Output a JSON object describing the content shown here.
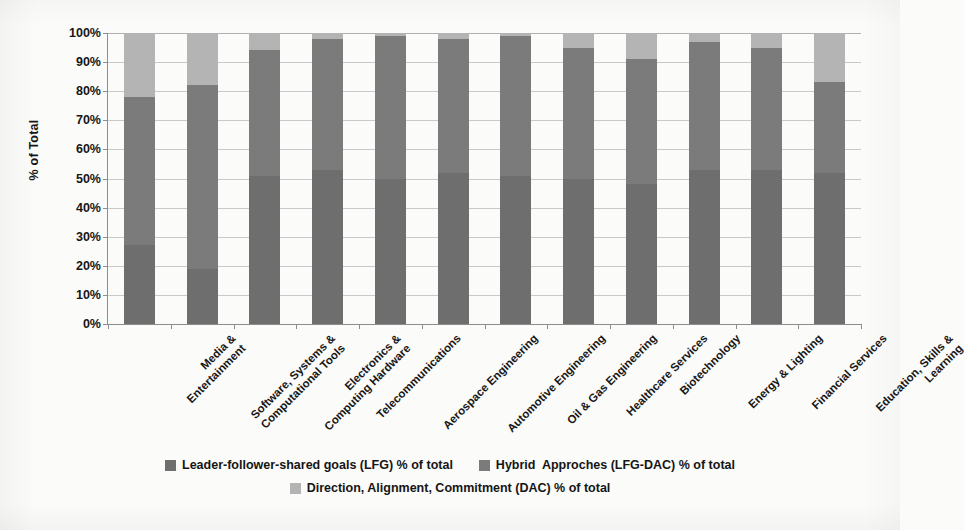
{
  "chart_data": {
    "type": "bar",
    "subtype": "stacked-100-percent",
    "title": "",
    "xlabel": "",
    "ylabel": "% of Total",
    "ylim": [
      0,
      100
    ],
    "ytick_labels": [
      "100%",
      "90%",
      "80%",
      "70%",
      "60%",
      "50%",
      "40%",
      "30%",
      "20%",
      "10%",
      "0%"
    ],
    "ytick_values": [
      100,
      90,
      80,
      70,
      60,
      50,
      40,
      30,
      20,
      10,
      0
    ],
    "grid": true,
    "legend_position": "bottom",
    "categories": [
      "Media & Entertainment",
      "Software, Systems & Computational Tools",
      "Electronics & Computing Hardware",
      "Telecommunications",
      "Aerospace Engineering",
      "Automotive Engineering",
      "Oil & Gas Engineering",
      "Healthcare Services",
      "Biotechnology",
      "Energy & Lighting",
      "Financial Services",
      "Education, Skills & Learning"
    ],
    "category_lines": [
      [
        "Media &",
        "Entertainment"
      ],
      [
        "Software, Systems &",
        "Computational Tools"
      ],
      [
        "Electronics &",
        "Computing Hardware"
      ],
      [
        "Telecommunications"
      ],
      [
        "Aerospace Engineering"
      ],
      [
        "Automotive Engineering"
      ],
      [
        "Oil & Gas Engineering"
      ],
      [
        "Healthcare Services"
      ],
      [
        "Biotechnology"
      ],
      [
        "Energy & Lighting"
      ],
      [
        "Financial Services"
      ],
      [
        "Education, Skills &",
        "Learning"
      ]
    ],
    "series": [
      {
        "name": "Leader-follower-shared goals (LFG) % of total",
        "key": "lfg",
        "color": "#6e6e6e",
        "values": [
          27,
          19,
          51,
          53,
          50,
          52,
          51,
          50,
          48,
          53,
          53,
          52
        ]
      },
      {
        "name": "Hybrid  Approches (LFG-DAC) % of total",
        "key": "hybrid",
        "color": "#7b7b7b",
        "values": [
          51,
          63,
          43,
          45,
          49,
          46,
          48,
          45,
          43,
          44,
          42,
          31
        ]
      },
      {
        "name": "Direction, Alignment, Commitment (DAC) % of total",
        "key": "dac",
        "color": "#b4b4b4",
        "values": [
          22,
          18,
          6,
          2,
          1,
          2,
          1,
          5,
          9,
          3,
          5,
          17
        ]
      }
    ]
  },
  "legend": {
    "items": [
      {
        "label": "Leader-follower-shared goals (LFG) % of total",
        "color": "#6e6e6e"
      },
      {
        "label": "Hybrid  Approches (LFG-DAC) % of total",
        "color": "#7b7b7b"
      },
      {
        "label": "Direction, Alignment, Commitment (DAC) % of total",
        "color": "#b4b4b4"
      }
    ]
  },
  "axis": {
    "y_title": "% of Total"
  }
}
